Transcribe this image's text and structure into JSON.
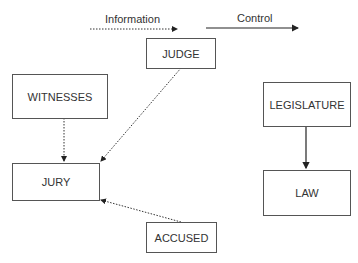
{
  "legend": {
    "information_label": "Information",
    "control_label": "Control"
  },
  "nodes": {
    "judge": "JUDGE",
    "witnesses": "WITNESSES",
    "jury": "JURY",
    "accused": "ACCUSED",
    "legislature": "LEGISLATURE",
    "law": "LAW"
  },
  "edges": [
    {
      "from": "WITNESSES",
      "to": "JURY",
      "type": "information"
    },
    {
      "from": "JUDGE",
      "to": "JURY",
      "type": "information"
    },
    {
      "from": "ACCUSED",
      "to": "JURY",
      "type": "information"
    },
    {
      "from": "LEGISLATURE",
      "to": "LAW",
      "type": "control"
    }
  ]
}
